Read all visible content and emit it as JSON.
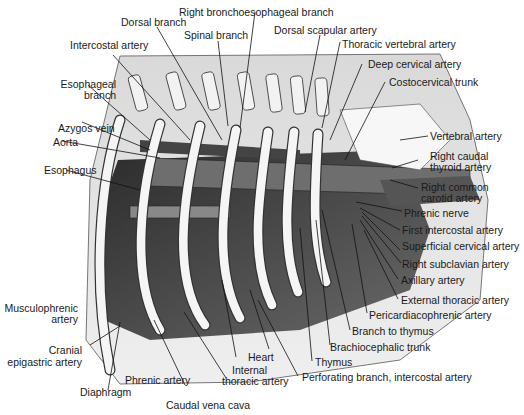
{
  "figure": {
    "labels": {
      "top": [
        "Right bronchoesophageal branch",
        "Dorsal branch",
        "Spinal branch",
        "Dorsal scapular artery",
        "Thoracic vertebral artery",
        "Intercostal artery",
        "Deep cervical artery",
        "Costocervical trunk"
      ],
      "left": [
        "Esophageal",
        "branch",
        "Azygos vein",
        "Aorta",
        "Esophagus",
        "Musculophrenic",
        "artery",
        "Cranial",
        "epigastric artery"
      ],
      "right": [
        "Vertebral artery",
        "Right caudal",
        "thyroid artery",
        "Right common",
        "carotid artery",
        "Phrenic nerve",
        "First intercostal artery",
        "Superficial cervical artery",
        "Right subclavian artery",
        "Axillary artery",
        "External thoracic artery",
        "Pericardiacophrenic artery",
        "Branch to thymus",
        "Brachiocephalic trunk",
        "Thymus",
        "Perforating branch, intercostal artery"
      ],
      "bottom": [
        "Heart",
        "Internal",
        "thoracic artery",
        "Phrenic artery",
        "Diaphragm",
        "Caudal vena cava"
      ]
    },
    "colors": {
      "background": "#ffffff",
      "bone": "#f4f4f4",
      "tissue_dark": "#3a3a3a",
      "tissue_mid": "#7a7a7a",
      "body_wall": "#e3e3e3",
      "line": "#111111"
    }
  }
}
